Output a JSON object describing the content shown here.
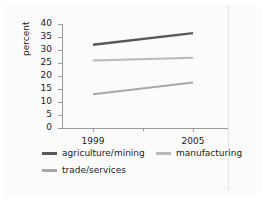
{
  "chart_data": {
    "type": "line",
    "title": "",
    "xlabel": "",
    "ylabel": "percent",
    "x": [
      "1999",
      "2005"
    ],
    "xlim": [
      "1999",
      "2005"
    ],
    "ylim": [
      0,
      40
    ],
    "ytick_step": 5,
    "yticks": [
      40,
      35,
      30,
      25,
      20,
      15,
      10,
      5,
      0
    ],
    "grid": false,
    "legend_position": "bottom",
    "series": [
      {
        "name": "agriculture/mining",
        "values": [
          32,
          36.5
        ],
        "color": "#585858"
      },
      {
        "name": "manufacturing",
        "values": [
          26,
          27
        ],
        "color": "#b9b9b9"
      },
      {
        "name": "trade/services",
        "values": [
          13,
          17.5
        ],
        "color": "#a8a8a8"
      }
    ]
  },
  "axes": {
    "y_title": "percent",
    "y_tick_labels": [
      "40",
      "35",
      "30",
      "25",
      "20",
      "15",
      "10",
      "5",
      "0"
    ],
    "x_tick_labels": [
      "1999",
      "2005"
    ],
    "axis_color": "#9a9a9d"
  },
  "legend": {
    "items": [
      {
        "label": "agriculture/mining",
        "color": "#585858"
      },
      {
        "label": "manufacturing",
        "color": "#b9b9b9"
      },
      {
        "label": "trade/services",
        "color": "#a8a8a8"
      }
    ]
  },
  "style": {
    "background": "#ffffff",
    "panel_background": "#fbfbfc",
    "text_color": "#1c1c1c",
    "rule_color": "#e3e3e5"
  }
}
